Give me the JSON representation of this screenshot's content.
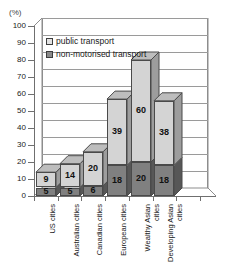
{
  "axis": {
    "unit_label": "(%)",
    "y_ticks": [
      0,
      10,
      20,
      30,
      40,
      50,
      60,
      70,
      80,
      90,
      100
    ],
    "y_min": 0,
    "y_max": 100
  },
  "legend": {
    "items": [
      {
        "key": "public-transport",
        "label": "public transport",
        "color": "#d4d4d4"
      },
      {
        "key": "non-motorised-transport",
        "label": "non-motorised transport",
        "color": "#808080"
      }
    ]
  },
  "chart_data": {
    "type": "bar",
    "title": "",
    "subtitle": "",
    "xlabel": "",
    "ylabel": "(%)",
    "ylim": [
      0,
      100
    ],
    "y_ticks": [
      0,
      10,
      20,
      30,
      40,
      50,
      60,
      70,
      80,
      90,
      100
    ],
    "grid": true,
    "stacked": true,
    "three_d": true,
    "legend_position": "top-left inside plot",
    "categories": [
      "US cities",
      "Australian cities",
      "Canadian cities",
      "European cities",
      "Wealthy Asian cities",
      "Developing Asian cities"
    ],
    "series": [
      {
        "name": "non-motorised transport",
        "color": "#808080",
        "values": [
          5,
          5,
          6,
          18,
          20,
          18
        ]
      },
      {
        "name": "public transport",
        "color": "#d4d4d4",
        "values": [
          9,
          14,
          20,
          39,
          60,
          38
        ]
      }
    ],
    "totals": [
      14,
      19,
      26,
      57,
      80,
      56
    ],
    "data_labels": [
      {
        "category": "US cities",
        "non_motorised": "5",
        "public": "9"
      },
      {
        "category": "Australian cities",
        "non_motorised": "5",
        "public": "14"
      },
      {
        "category": "Canadian cities",
        "non_motorised": "6",
        "public": "20"
      },
      {
        "category": "European cities",
        "non_motorised": "18",
        "public": "39"
      },
      {
        "category": "Wealthy Asian cities",
        "non_motorised": "20",
        "public": "60"
      },
      {
        "category": "Developing Asian cities",
        "non_motorised": "18",
        "public": "38"
      }
    ]
  },
  "categories_display": [
    "US cities",
    "Australian cities",
    "Canadian cities",
    "European cities",
    "Wealthy Asian\ncities",
    "Developing Asian\ncities"
  ]
}
